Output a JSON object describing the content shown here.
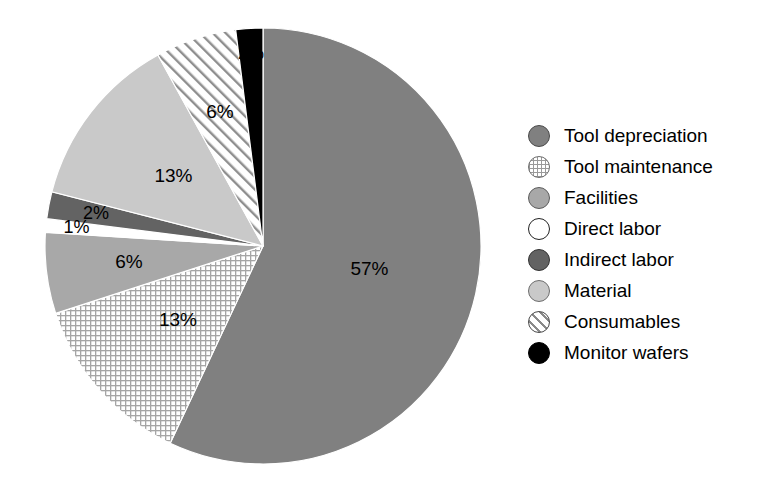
{
  "chart_data": {
    "type": "pie",
    "title": "",
    "subtitle": "",
    "xlabel": "",
    "ylabel": "",
    "legend_position": "right",
    "grid": false,
    "total": 100,
    "unit": "%",
    "categories": [
      "Tool depreciation",
      "Tool maintenance",
      "Facilities",
      "Direct labor",
      "Indirect labor",
      "Material",
      "Consumables",
      "Monitor wafers"
    ],
    "values": [
      57,
      13,
      6,
      1,
      2,
      13,
      6,
      2
    ],
    "data_labels": [
      "57%",
      "13%",
      "6%",
      "1%",
      "2%",
      "13%",
      "6%",
      "2%"
    ],
    "slices": [
      {
        "label": "Tool depreciation",
        "value": 57,
        "data_label": "57%",
        "fill": "#808080",
        "pattern": "solid",
        "swatch_class": "sw-solid-mid"
      },
      {
        "label": "Tool maintenance",
        "value": 13,
        "data_label": "13%",
        "fill": "#ffffff",
        "pattern": "grid",
        "swatch_class": "sw-grid"
      },
      {
        "label": "Facilities",
        "value": 6,
        "data_label": "6%",
        "fill": "#a8a8a8",
        "pattern": "solid",
        "swatch_class": "sw-solid-mid2"
      },
      {
        "label": "Direct labor",
        "value": 1,
        "data_label": "1%",
        "fill": "#ffffff",
        "pattern": "solid",
        "swatch_class": "sw-white"
      },
      {
        "label": "Indirect labor",
        "value": 2,
        "data_label": "2%",
        "fill": "#636363",
        "pattern": "solid",
        "swatch_class": "sw-solid-dark"
      },
      {
        "label": "Material",
        "value": 13,
        "data_label": "13%",
        "fill": "#c9c9c9",
        "pattern": "solid",
        "swatch_class": "sw-solid-light"
      },
      {
        "label": "Consumables",
        "value": 6,
        "data_label": "6%",
        "fill": "#ffffff",
        "pattern": "diagonal",
        "swatch_class": "sw-hatch"
      },
      {
        "label": "Monitor wafers",
        "value": 2,
        "data_label": "2%",
        "fill": "#000000",
        "pattern": "solid",
        "swatch_class": "sw-black"
      }
    ]
  },
  "legend": {
    "items": [
      {
        "label": "Tool depreciation"
      },
      {
        "label": "Tool maintenance"
      },
      {
        "label": "Facilities"
      },
      {
        "label": "Direct labor"
      },
      {
        "label": "Indirect labor"
      },
      {
        "label": "Material"
      },
      {
        "label": "Consumables"
      },
      {
        "label": "Monitor wafers"
      }
    ]
  },
  "pie_labels": {
    "tool_depreciation": "57%",
    "tool_maintenance": "13%",
    "facilities": "6%",
    "direct_labor": "1%",
    "indirect_labor": "2%",
    "material": "13%",
    "consumables": "6%",
    "monitor_wafers": "2%"
  }
}
